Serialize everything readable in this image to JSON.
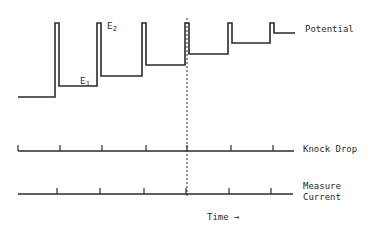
{
  "labels": {
    "potential": "Potential",
    "knock_drop": "Knock Drop",
    "measure_line1": "Measure",
    "measure_line2": "Current",
    "time": "Time",
    "time_arrow": "→",
    "e1_base": "E",
    "e1_sub": "1",
    "e2_base": "E",
    "e2_sub": "2"
  },
  "colors": {
    "stroke": "#2a2a2a",
    "background": "#ffffff"
  },
  "potential_trace": {
    "baseline": {
      "x0": 18,
      "x1": 55,
      "y": 97
    },
    "pulse_top_y": 23,
    "steps": [
      {
        "spike_x0": 55,
        "spike_x1": 59,
        "level_y": 86,
        "level_x_end": 97
      },
      {
        "spike_x0": 97,
        "spike_x1": 101,
        "level_y": 76,
        "level_x_end": 142
      },
      {
        "spike_x0": 142,
        "spike_x1": 146,
        "level_y": 65,
        "level_x_end": 185
      },
      {
        "spike_x0": 185,
        "spike_x1": 189,
        "level_y": 54,
        "level_x_end": 228
      },
      {
        "spike_x0": 228,
        "spike_x1": 232,
        "level_y": 43,
        "level_x_end": 270
      },
      {
        "spike_x0": 270,
        "spike_x1": 274,
        "level_y": 33,
        "level_x_end": 295
      }
    ]
  },
  "knock_drop": {
    "y": 151,
    "x0": 18,
    "x1": 294,
    "ticks": [
      18,
      60,
      102,
      146,
      187,
      231,
      273
    ]
  },
  "measure_current": {
    "y": 194,
    "x0": 18,
    "x1": 293,
    "ticks": [
      57,
      100,
      144,
      186,
      229,
      271
    ]
  },
  "marker_line": {
    "x": 187,
    "y0": 18,
    "y1": 196
  }
}
